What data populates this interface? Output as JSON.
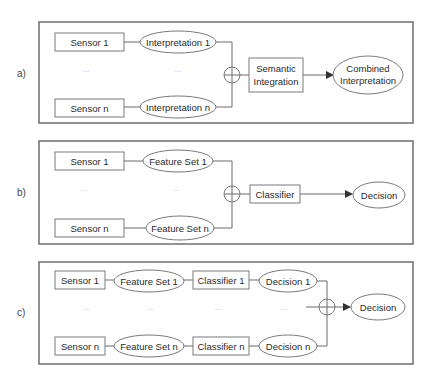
{
  "panels": {
    "a": {
      "label": "a)",
      "sensor_1": "Sensor 1",
      "sensor_n": "Sensor n",
      "interp_1": "Interpretation 1",
      "interp_n": "Interpretation n",
      "ellipsis": "...",
      "integration_line1": "Semantic",
      "integration_line2": "Integration",
      "output_line1": "Combined",
      "output_line2": "Interpretation"
    },
    "b": {
      "label": "b)",
      "sensor_1": "Sensor 1",
      "sensor_n": "Sensor n",
      "feature_1": "Feature Set 1",
      "feature_n": "Feature Set n",
      "ellipsis": "...",
      "classifier": "Classifier",
      "output": "Decision"
    },
    "c": {
      "label": "c)",
      "sensor_1": "Sensor 1",
      "sensor_n": "Sensor n",
      "feature_1": "Feature Set 1",
      "feature_n": "Feature Set n",
      "classifier_1": "Classifier 1",
      "classifier_n": "Classifier n",
      "decision_1": "Decision 1",
      "decision_n": "Decision n",
      "ellipsis": "...",
      "output": "Decision"
    }
  }
}
